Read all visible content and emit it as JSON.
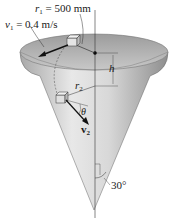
{
  "diagram": {
    "type": "cone-with-block",
    "labels": {
      "r1": {
        "symbol": "r",
        "sub": "1",
        "value": "= 500 mm"
      },
      "v1": {
        "symbol": "v",
        "sub": "1",
        "value": "= 0.4 m/s"
      },
      "h": {
        "symbol": "h"
      },
      "r2": {
        "symbol": "r",
        "sub": "2"
      },
      "theta": {
        "symbol": "θ"
      },
      "v2": {
        "symbol": "v",
        "sub": "2"
      },
      "angle": {
        "value": "30°"
      }
    },
    "colors": {
      "cone_light": "#e6e6e6",
      "cone_dark": "#9a9a9a",
      "rim_inner": "#b8b8b8",
      "line": "#222222"
    }
  }
}
